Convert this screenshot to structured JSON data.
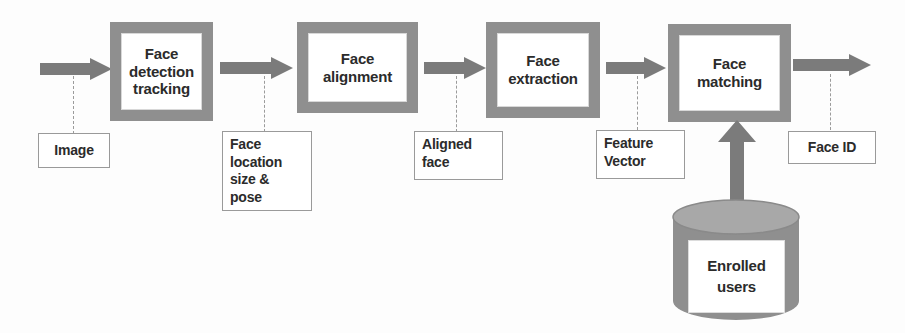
{
  "diagram": {
    "colors": {
      "stage_frame": "#8f8f8f",
      "stage_fill": "#ffffff",
      "note_border": "#9a9a9a",
      "arrow": "#7b7b7b",
      "cylinder_body": "#8f8f8f",
      "cylinder_top": "#a6a6a6",
      "text": "#2b2b2b",
      "background": "#fdfdfd"
    },
    "stages": [
      {
        "id": "face-detection-tracking",
        "label": "Face\ndetection\ntracking"
      },
      {
        "id": "face-alignment",
        "label": "Face\nalignment"
      },
      {
        "id": "face-extraction",
        "label": "Face\nextraction"
      },
      {
        "id": "face-matching",
        "label": "Face\nmatching"
      }
    ],
    "notes": [
      {
        "id": "image",
        "label": "Image"
      },
      {
        "id": "face-location-size-pose",
        "label": "Face\nlocation\nsize &\npose"
      },
      {
        "id": "aligned-face",
        "label": "Aligned\nface"
      },
      {
        "id": "feature-vector",
        "label": "Feature\nVector"
      },
      {
        "id": "face-id",
        "label": "Face ID"
      }
    ],
    "datastore": {
      "id": "enrolled-users",
      "label": "Enrolled\nusers",
      "shape": "cylinder"
    },
    "arrows": [
      {
        "id": "arrow-input-to-detection",
        "direction": "right"
      },
      {
        "id": "arrow-detection-to-alignment",
        "direction": "right"
      },
      {
        "id": "arrow-alignment-to-extraction",
        "direction": "right"
      },
      {
        "id": "arrow-extraction-to-matching",
        "direction": "right"
      },
      {
        "id": "arrow-matching-to-output",
        "direction": "right"
      },
      {
        "id": "arrow-datastore-to-matching",
        "direction": "up"
      }
    ]
  }
}
